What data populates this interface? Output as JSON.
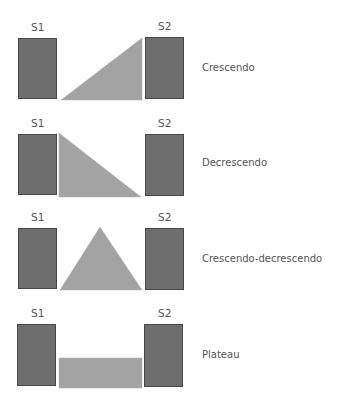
{
  "colors": {
    "sound_box_fill": "#6e6e6e",
    "sound_box_border": "#474747",
    "murmur_fill": "#a3a3a3",
    "text": "#555555",
    "background": "#ffffff"
  },
  "rows": [
    {
      "s1": "S1",
      "s2": "S2",
      "label": "Crescendo",
      "shape": "triangle-rising"
    },
    {
      "s1": "S1",
      "s2": "S2",
      "label": "Decrescendo",
      "shape": "triangle-falling"
    },
    {
      "s1": "S1",
      "s2": "S2",
      "label": "Crescendo-decrescendo",
      "shape": "triangle-diamond"
    },
    {
      "s1": "S1",
      "s2": "S2",
      "label": "Plateau",
      "shape": "rectangle"
    }
  ]
}
